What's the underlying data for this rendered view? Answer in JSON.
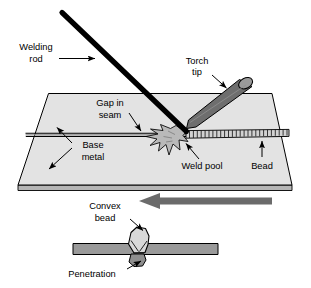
{
  "figure": {
    "labels": {
      "welding_rod_line1": "Welding",
      "welding_rod_line2": "rod",
      "torch_tip_line1": "Torch",
      "torch_tip_line2": "tip",
      "gap_in_seam_line1": "Gap in",
      "gap_in_seam_line2": "seam",
      "base_metal_line1": "Base",
      "base_metal_line2": "metal",
      "weld_pool": "Weld pool",
      "bead": "Bead",
      "convex_bead_line1": "Convex",
      "convex_bead_line2": "bead",
      "penetration": "Penetration"
    },
    "icons": {
      "welding_rod": "welding-rod-icon",
      "torch_tip": "torch-tip-icon",
      "weld_pool": "weld-pool-icon",
      "bead_ripples": "bead-ripple-icon",
      "travel_arrow": "travel-direction-arrow-icon",
      "cross_section": "weld-cross-section-icon"
    },
    "colors": {
      "outline": "#000000",
      "plate_fill": "#e3e3e3",
      "plate_edge_fill": "#b5b5b5",
      "torch_fill": "#6e6e6e",
      "torch_opening_fill": "#9a9a9a",
      "rod_fill": "#000000",
      "pool_fill": "#b9b9b9",
      "bead_fill": "#d2d2d2",
      "travel_arrow_fill": "#6b6b6b",
      "section_plate_fill": "#9a9a9a",
      "section_bead_fill": "#d8d8d8",
      "text": "#000000",
      "background": "#ffffff"
    }
  }
}
